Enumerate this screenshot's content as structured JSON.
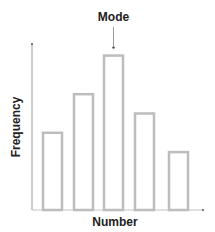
{
  "chart_data": {
    "type": "bar",
    "title": "",
    "xlabel": "Number",
    "ylabel": "Frequency",
    "categories": [
      "1",
      "2",
      "3",
      "4",
      "5"
    ],
    "values": [
      2,
      3,
      4,
      2.5,
      1.5
    ],
    "ylim": [
      0,
      4.3
    ],
    "grid": false,
    "legend": null,
    "tick_labels_shown": false,
    "annotations": [
      {
        "text": "Mode",
        "target_index": 2,
        "arrow": true
      }
    ],
    "style": {
      "bar_fill": "none",
      "bar_stroke": "#bdbdbd",
      "axis_color": "#888888",
      "text_color": "#222222"
    }
  }
}
